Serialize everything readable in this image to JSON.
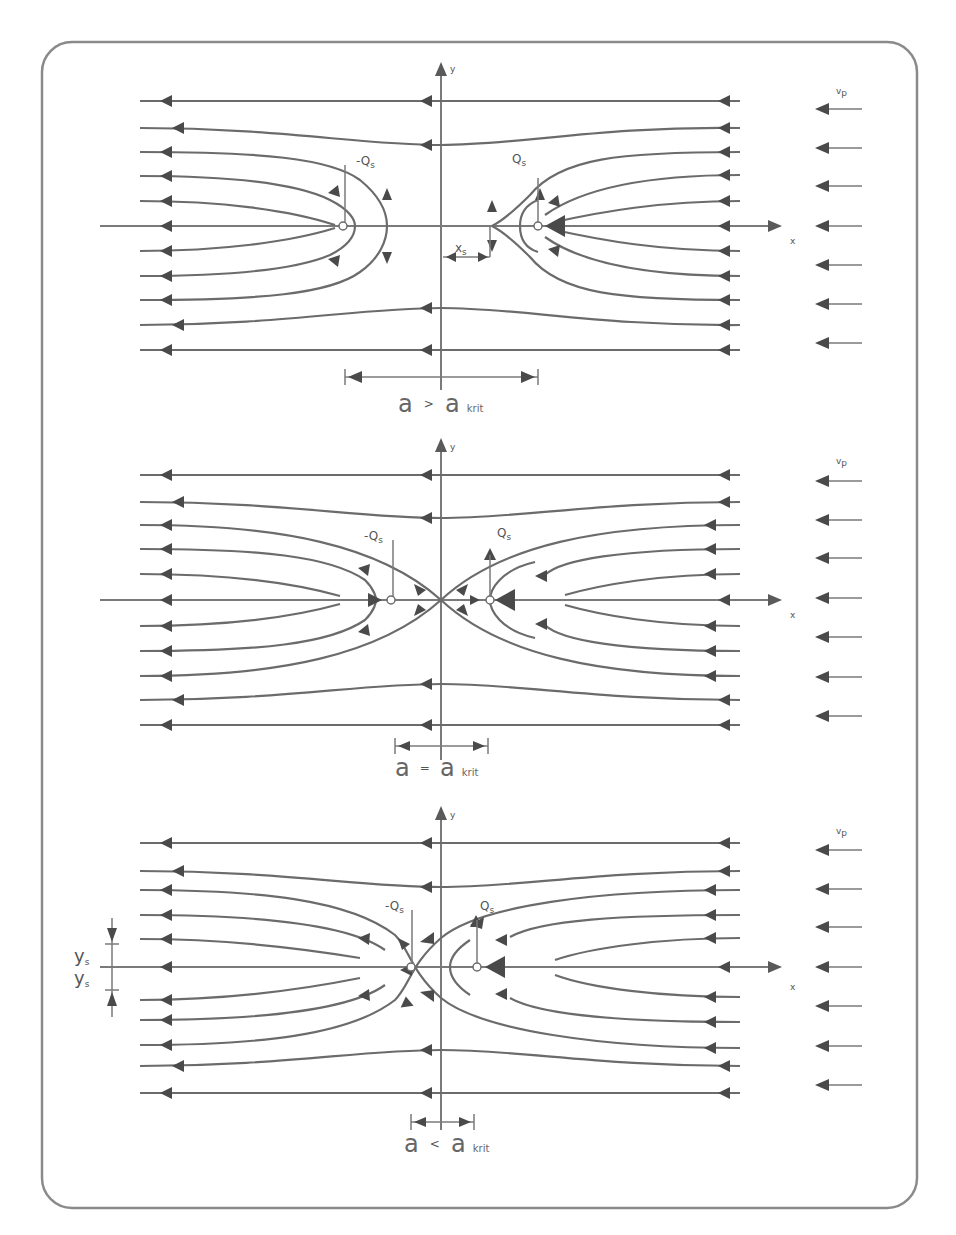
{
  "figure": {
    "colors": {
      "line": "#6b6b6b",
      "arrow": "#4a4a4a",
      "frame": "#8a8a8a",
      "text": "#555555",
      "background": "#ffffff"
    },
    "panels": [
      {
        "id": "panel-1",
        "axis_y_label": "y",
        "axis_x_label": "x",
        "sink_label": "-Q",
        "sink_sub": "s",
        "source_label": "Q",
        "source_sub": "s",
        "stagnation_label": "x",
        "stagnation_sub": "s",
        "flow_label": "v",
        "flow_sub": "p",
        "dimension_label_a": "a",
        "dimension_relation": ">",
        "dimension_label_b": "a",
        "dimension_sub": "krit",
        "condition": "a > a_krit"
      },
      {
        "id": "panel-2",
        "axis_y_label": "y",
        "axis_x_label": "x",
        "sink_label": "-Q",
        "sink_sub": "s",
        "source_label": "Q",
        "source_sub": "s",
        "flow_label": "v",
        "flow_sub": "p",
        "dimension_label_a": "a",
        "dimension_relation": "=",
        "dimension_label_b": "a",
        "dimension_sub": "krit",
        "condition": "a = a_krit"
      },
      {
        "id": "panel-3",
        "axis_y_label": "y",
        "axis_x_label": "x",
        "sink_label": "-Q",
        "sink_sub": "s",
        "source_label": "Q",
        "source_sub": "s",
        "flow_label": "v",
        "flow_sub": "p",
        "ys_upper_label": "y",
        "ys_lower_label": "y",
        "ys_sub": "s",
        "dimension_label_a": "a",
        "dimension_relation": "<",
        "dimension_label_b": "a",
        "dimension_sub": "krit",
        "condition": "a < a_krit"
      }
    ]
  }
}
